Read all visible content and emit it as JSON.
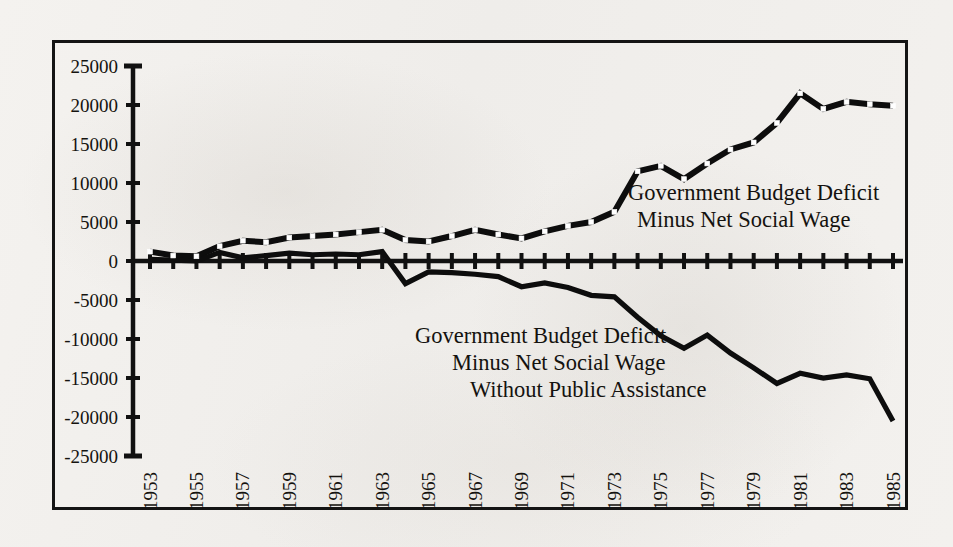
{
  "figure": {
    "background_color": "#f2f0ed",
    "ink_color": "#0d0d0d",
    "frame_border_color": "#141414"
  },
  "annotations": {
    "upper": {
      "line1": "Government Budget Deficit",
      "line2": "Minus Net Social Wage"
    },
    "lower": {
      "line1": "Government Budget Deficit",
      "line2": "Minus Net Social Wage",
      "line3": "Without Public Assistance"
    }
  },
  "chart_data": {
    "type": "line",
    "title": "",
    "subtitle": "",
    "xlabel": "",
    "ylabel": "",
    "xlim": [
      1953,
      1985
    ],
    "ylim": [
      -25000,
      25000
    ],
    "grid": false,
    "legend_position": "inline-annotation",
    "y_ticks": [
      25000,
      20000,
      15000,
      10000,
      5000,
      0,
      -5000,
      -10000,
      -15000,
      -20000,
      -25000
    ],
    "y_tick_labels": [
      "25000",
      "20000",
      "15000",
      "10000",
      "5000",
      "0",
      "-5000",
      "-10000",
      "-15000",
      "-20000",
      "-25000"
    ],
    "x_ticks": [
      1953,
      1954,
      1955,
      1956,
      1957,
      1958,
      1959,
      1960,
      1961,
      1962,
      1963,
      1964,
      1965,
      1966,
      1967,
      1968,
      1969,
      1970,
      1971,
      1972,
      1973,
      1974,
      1975,
      1976,
      1977,
      1978,
      1979,
      1980,
      1981,
      1982,
      1983,
      1984,
      1985
    ],
    "x_tick_labels": [
      "1953",
      "",
      "1955",
      "",
      "1957",
      "",
      "1959",
      "",
      "1961",
      "",
      "1963",
      "",
      "1965",
      "",
      "1967",
      "",
      "1969",
      "",
      "1971",
      "",
      "1973",
      "",
      "1975",
      "",
      "1977",
      "",
      "1979",
      "",
      "1981",
      "",
      "1983",
      "",
      "1985"
    ],
    "x": [
      1953,
      1954,
      1955,
      1956,
      1957,
      1958,
      1959,
      1960,
      1961,
      1962,
      1963,
      1964,
      1965,
      1966,
      1967,
      1968,
      1969,
      1970,
      1971,
      1972,
      1973,
      1974,
      1975,
      1976,
      1977,
      1978,
      1979,
      1980,
      1981,
      1982,
      1983,
      1984,
      1985
    ],
    "series": [
      {
        "name": "Government Budget Deficit Minus Net Social Wage",
        "marker": "white-square",
        "line_style": "solid-thick",
        "values": [
          1200,
          700,
          600,
          1900,
          2600,
          2400,
          3000,
          3200,
          3400,
          3700,
          4000,
          2700,
          2500,
          3200,
          4000,
          3400,
          2900,
          3800,
          4500,
          5000,
          6300,
          11500,
          12200,
          10500,
          12500,
          14300,
          15200,
          17700,
          21500,
          19500,
          20400,
          20100,
          19900
        ]
      },
      {
        "name": "Government Budget Deficit Minus Net Social Wage Without Public Assistance",
        "marker": "none",
        "line_style": "solid-thick",
        "values": [
          200,
          100,
          0,
          1100,
          400,
          700,
          1000,
          800,
          900,
          800,
          1200,
          -2900,
          -1400,
          -1500,
          -1700,
          -2000,
          -3300,
          -2800,
          -3400,
          -4400,
          -4600,
          -7200,
          -9600,
          -11200,
          -9500,
          -11800,
          -13700,
          -15700,
          -14400,
          -15000,
          -14600,
          -15100,
          -20500
        ]
      }
    ]
  }
}
